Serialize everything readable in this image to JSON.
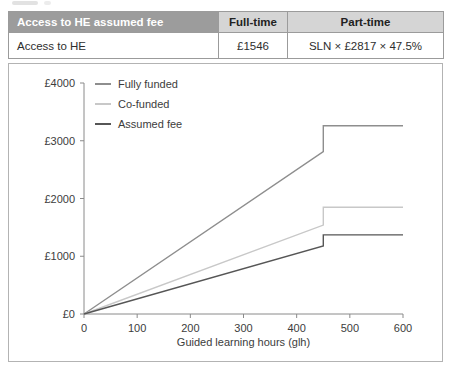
{
  "table": {
    "header": {
      "title": "Access to HE assumed fee",
      "full_time": "Full-time",
      "part_time": "Part-time"
    },
    "row": {
      "label": "Access to HE",
      "full_time": "£1546",
      "part_time": "SLN × £2817 × 47.5%"
    }
  },
  "chart_data": {
    "type": "line",
    "title": "",
    "xlabel": "Guided learning hours (glh)",
    "ylabel": "",
    "xlim": [
      0,
      600
    ],
    "ylim": [
      0,
      4000
    ],
    "grid": false,
    "legend_position": "top-left-inside",
    "x_ticks": [
      0,
      100,
      200,
      300,
      400,
      500,
      600
    ],
    "y_ticks": [
      {
        "label": "£0",
        "value": 0
      },
      {
        "label": "£1000",
        "value": 1000
      },
      {
        "label": "£2000",
        "value": 2000
      },
      {
        "label": "£3000",
        "value": 3000
      },
      {
        "label": "£4000",
        "value": 4000
      }
    ],
    "series": [
      {
        "name": "Fully funded",
        "color": "#8e8e8e",
        "points": [
          [
            0,
            0
          ],
          [
            450,
            2810
          ],
          [
            450,
            3260
          ],
          [
            600,
            3260
          ]
        ]
      },
      {
        "name": "Co-funded",
        "color": "#c8c8c8",
        "points": [
          [
            0,
            0
          ],
          [
            450,
            1540
          ],
          [
            450,
            1850
          ],
          [
            600,
            1850
          ]
        ]
      },
      {
        "name": "Assumed fee",
        "color": "#565656",
        "points": [
          [
            0,
            0
          ],
          [
            450,
            1180
          ],
          [
            450,
            1370
          ],
          [
            600,
            1370
          ]
        ]
      }
    ]
  },
  "colors": {
    "table_header_bg": "#9c9c9c",
    "table_subheader_bg": "#d5d5d5",
    "table_border": "#9b9b9b",
    "panel_border": "#b3b3b3",
    "axis": "#8a8a8a",
    "text": "#3c3c3c"
  }
}
